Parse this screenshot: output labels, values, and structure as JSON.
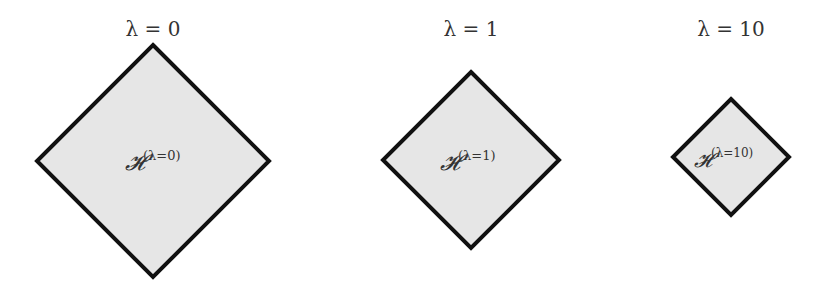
{
  "figure": {
    "panels": [
      {
        "title": "λ = 0",
        "region_label": "𝓗",
        "superscript": "(λ=0)",
        "center": [
          153,
          161
        ],
        "half_size": 116
      },
      {
        "title": "λ = 1",
        "region_label": "𝓗",
        "superscript": "(λ=1)",
        "center": [
          471,
          160
        ],
        "half_size": 88
      },
      {
        "title": "λ = 10",
        "region_label": "𝓗",
        "superscript": "(λ=10)",
        "center": [
          731,
          157
        ],
        "half_size": 58
      }
    ],
    "colors": {
      "fill": "#e6e6e6",
      "stroke": "#111111",
      "text": "#333333"
    }
  }
}
